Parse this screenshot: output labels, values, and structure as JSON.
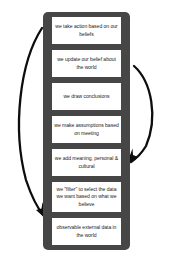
{
  "diagram": {
    "name": "ladder-of-inference",
    "colors": {
      "ladder": "#464646",
      "rung_background": "#ffffff",
      "text": "#1b1b1b",
      "arrow": "#0d0d0d",
      "page_background": "#ffffff"
    },
    "steps": [
      {
        "id": "take-action",
        "text": "we take action based on our beliefs",
        "lines": 2
      },
      {
        "id": "update-belief",
        "text": "we update our belief about the world",
        "lines": 2
      },
      {
        "id": "draw-conclusions",
        "text": "we draw conclusions",
        "lines": 1
      },
      {
        "id": "make-assumptions",
        "text": "we make assumptions based on meeting",
        "lines": 2
      },
      {
        "id": "add-meaning",
        "text": "we add meaning, personal & cultural",
        "lines": 2
      },
      {
        "id": "filter-data",
        "text": "we \"filter\" to select the data we want based on what we believe",
        "lines": 3
      },
      {
        "id": "observable-data",
        "text": "observable external data in the world",
        "lines": 2
      }
    ],
    "arrows": [
      {
        "id": "left-feedback-arrow",
        "direction": "downward",
        "side": "left"
      },
      {
        "id": "right-feedback-arrow",
        "direction": "downward",
        "side": "right"
      }
    ]
  }
}
